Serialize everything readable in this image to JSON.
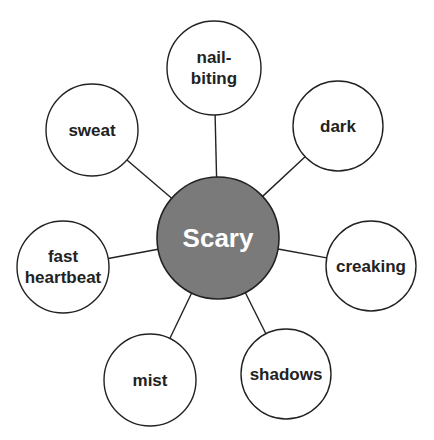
{
  "diagram": {
    "type": "spider-map",
    "colors": {
      "center_fill": "#7a7a7a",
      "center_text": "#ffffff",
      "stroke": "#222222",
      "node_fill": "#ffffff",
      "node_text": "#222222"
    },
    "center": {
      "label": "Scary",
      "cx": 218,
      "cy": 238,
      "r": 61
    },
    "nodes": [
      {
        "id": "nail-biting",
        "lines": [
          "nail-",
          "biting"
        ],
        "cx": 214,
        "cy": 68,
        "r": 47
      },
      {
        "id": "dark",
        "lines": [
          "dark"
        ],
        "cx": 338,
        "cy": 126,
        "r": 45
      },
      {
        "id": "creaking",
        "lines": [
          "creaking"
        ],
        "cx": 371,
        "cy": 266,
        "r": 45
      },
      {
        "id": "shadows",
        "lines": [
          "shadows"
        ],
        "cx": 286,
        "cy": 374,
        "r": 45
      },
      {
        "id": "mist",
        "lines": [
          "mist"
        ],
        "cx": 150,
        "cy": 380,
        "r": 46
      },
      {
        "id": "fast-heartbeat",
        "lines": [
          "fast",
          "heartbeat"
        ],
        "cx": 63,
        "cy": 267,
        "r": 46
      },
      {
        "id": "sweat",
        "lines": [
          "sweat"
        ],
        "cx": 92,
        "cy": 130,
        "r": 46
      }
    ]
  }
}
